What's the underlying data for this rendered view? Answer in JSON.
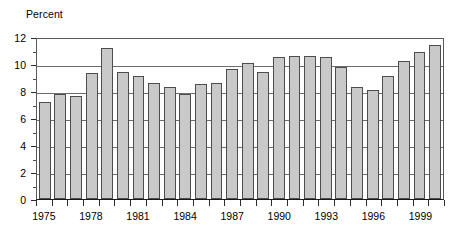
{
  "chart_data": {
    "type": "bar",
    "title": "",
    "ylabel": "Percent",
    "xlabel": "",
    "ylim": [
      0,
      12
    ],
    "grid": true,
    "legend": "none",
    "y_ticks": [
      0,
      2,
      4,
      6,
      8,
      10,
      12
    ],
    "y_tick_labels": [
      "0",
      "2",
      "4",
      "6",
      "8",
      "10",
      "12"
    ],
    "x_tick_labels": [
      "1975",
      "1978",
      "1981",
      "1984",
      "1987",
      "1990",
      "1993",
      "1996",
      "1999"
    ],
    "categories": [
      "1975",
      "1976",
      "1977",
      "1978",
      "1979",
      "1980",
      "1981",
      "1982",
      "1983",
      "1984",
      "1985",
      "1986",
      "1987",
      "1988",
      "1989",
      "1990",
      "1991",
      "1992",
      "1993",
      "1994",
      "1995",
      "1996",
      "1997",
      "1998",
      "1999",
      "2000"
    ],
    "values": [
      7.2,
      7.8,
      7.6,
      9.3,
      11.2,
      9.4,
      9.1,
      8.6,
      8.3,
      7.8,
      8.5,
      8.6,
      9.6,
      10.1,
      9.4,
      10.5,
      10.6,
      10.6,
      10.5,
      9.8,
      8.3,
      8.1,
      9.1,
      10.2,
      10.9,
      11.4
    ],
    "bar_color": "#c9c9c9",
    "bar_edge_color": "#4d4d4d",
    "gridline_color": "#6e6e6e",
    "axis_color": "#1a1a1a",
    "background_color": "#ffffff"
  }
}
